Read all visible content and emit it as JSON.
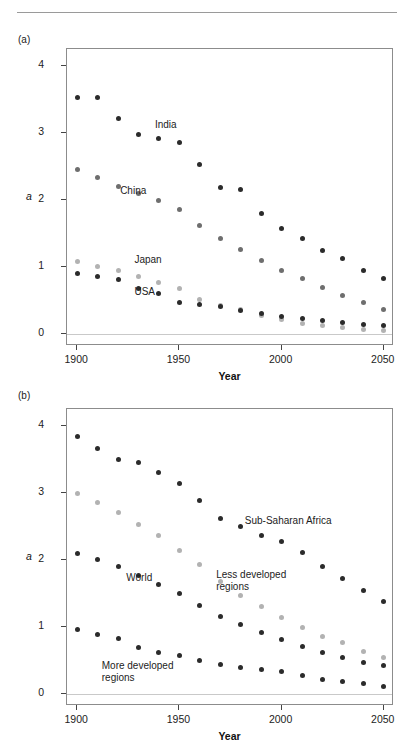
{
  "page": {
    "header_text": "",
    "background": "#ffffff"
  },
  "colors": {
    "dark": "#2b2b2b",
    "mid": "#6e6e6e",
    "light": "#b2b2b2",
    "axis": "#8c8c8c",
    "zeroline": "#c9c9c9"
  },
  "panels": [
    {
      "tag": "(a)",
      "name": "panel-a",
      "chart_data": {
        "type": "scatter",
        "title": "",
        "xlabel": "Year",
        "ylabel": "a",
        "xlim": [
          1895,
          2055
        ],
        "ylim": [
          -0.18,
          4.25
        ],
        "xticks": [
          1900,
          1950,
          2000,
          2050
        ],
        "yticks": [
          0,
          1,
          2,
          3,
          4
        ],
        "grid": false,
        "legend": "inline-annotations",
        "x": [
          1900,
          1910,
          1920,
          1930,
          1940,
          1950,
          1960,
          1970,
          1980,
          1990,
          2000,
          2010,
          2020,
          2030,
          2040,
          2050
        ],
        "series": [
          {
            "name": "India",
            "color": "#2b2b2b",
            "label_x": 1938,
            "label_y": 3.12,
            "values": [
              3.52,
              3.52,
              3.22,
              2.97,
              2.92,
              2.86,
              2.52,
              2.18,
              2.15,
              1.79,
              1.58,
              1.42,
              1.25,
              1.13,
              0.95,
              0.82
            ]
          },
          {
            "name": "China",
            "color": "#6e6e6e",
            "label_x": 1921,
            "label_y": 2.13,
            "values": [
              2.46,
              2.33,
              2.2,
              2.1,
              1.99,
              1.85,
              1.62,
              1.42,
              1.26,
              1.1,
              0.95,
              0.82,
              0.7,
              0.58,
              0.47,
              0.36
            ]
          },
          {
            "name": "Japan",
            "color": "#b2b2b2",
            "label_x": 1928,
            "label_y": 1.1,
            "values": [
              1.08,
              1.01,
              0.94,
              0.86,
              0.77,
              0.68,
              0.52,
              0.42,
              0.36,
              0.28,
              0.21,
              0.16,
              0.12,
              0.09,
              0.07,
              0.05
            ]
          },
          {
            "name": "USA",
            "color": "#2b2b2b",
            "label_x": 1928,
            "label_y": 0.62,
            "values": [
              0.9,
              0.86,
              0.81,
              0.68,
              0.6,
              0.47,
              0.44,
              0.41,
              0.35,
              0.3,
              0.26,
              0.23,
              0.2,
              0.17,
              0.14,
              0.12
            ]
          }
        ]
      }
    },
    {
      "tag": "(b)",
      "name": "panel-b",
      "chart_data": {
        "type": "scatter",
        "title": "",
        "xlabel": "Year",
        "ylabel": "a",
        "xlim": [
          1895,
          2055
        ],
        "ylim": [
          -0.18,
          4.25
        ],
        "xticks": [
          1900,
          1950,
          2000,
          2050
        ],
        "yticks": [
          0,
          1,
          2,
          3,
          4
        ],
        "grid": false,
        "legend": "inline-annotations",
        "x": [
          1900,
          1910,
          1920,
          1930,
          1940,
          1950,
          1960,
          1970,
          1980,
          1990,
          2000,
          2010,
          2020,
          2030,
          2040,
          2050
        ],
        "series": [
          {
            "name": "Sub-Saharan Africa",
            "color": "#2b2b2b",
            "label_x": 1982,
            "label_y": 2.58,
            "values": [
              3.84,
              3.66,
              3.5,
              3.45,
              3.3,
              3.14,
              2.89,
              2.62,
              2.5,
              2.36,
              2.28,
              2.11,
              1.9,
              1.72,
              1.55,
              1.38
            ]
          },
          {
            "name": "Less developed regions",
            "color": "#b2b2b2",
            "label_x": 1968,
            "label_y": 1.78,
            "values": [
              2.99,
              2.85,
              2.71,
              2.53,
              2.36,
              2.14,
              1.93,
              1.68,
              1.47,
              1.3,
              1.14,
              0.99,
              0.86,
              0.76,
              0.64,
              0.55
            ]
          },
          {
            "name": "World",
            "color": "#2b2b2b",
            "label_x": 1924,
            "label_y": 1.73,
            "values": [
              2.09,
              2.0,
              1.9,
              1.77,
              1.63,
              1.5,
              1.32,
              1.16,
              1.03,
              0.92,
              0.81,
              0.71,
              0.62,
              0.55,
              0.47,
              0.42
            ]
          },
          {
            "name": "More developed regions",
            "color": "#2b2b2b",
            "label_x": 1912,
            "label_y": 0.42,
            "values": [
              0.96,
              0.89,
              0.83,
              0.7,
              0.62,
              0.57,
              0.5,
              0.44,
              0.4,
              0.37,
              0.33,
              0.27,
              0.22,
              0.19,
              0.15,
              0.11
            ]
          }
        ]
      }
    }
  ]
}
